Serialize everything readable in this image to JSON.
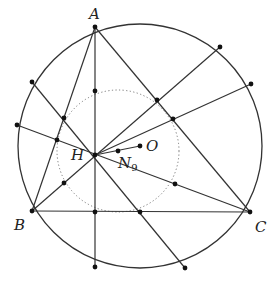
{
  "diagram": {
    "title": "",
    "circumcircle": {
      "cx": 140,
      "cy": 146,
      "r": 122,
      "stroke": "#333333"
    },
    "nine_point_circle": {
      "cx": 118,
      "cy": 151,
      "r": 61,
      "stroke": "#777777",
      "style": "dotted"
    },
    "vertices": {
      "A": {
        "x": 95,
        "y": 27,
        "label": "A",
        "lx": 89,
        "ly": 19
      },
      "B": {
        "x": 32,
        "y": 211,
        "label": "B",
        "lx": 14,
        "ly": 230
      },
      "C": {
        "x": 250,
        "y": 212,
        "label": "C",
        "lx": 255,
        "ly": 232
      }
    },
    "centers": {
      "H": {
        "x": 95,
        "y": 155,
        "label": "H",
        "lx": 71,
        "ly": 160
      },
      "O": {
        "x": 140,
        "y": 146,
        "label": "O",
        "lx": 146,
        "ly": 151
      },
      "N9": {
        "x": 118,
        "y": 151,
        "label": "N",
        "sub": "9",
        "lx": 118,
        "ly": 168
      }
    },
    "segments": [
      {
        "from": [
          95,
          27
        ],
        "to": [
          32,
          211
        ],
        "name": "side-AB"
      },
      {
        "from": [
          95,
          27
        ],
        "to": [
          250,
          212
        ],
        "name": "side-AC"
      },
      {
        "from": [
          32,
          211
        ],
        "to": [
          250,
          212
        ],
        "name": "side-BC"
      },
      {
        "from": [
          95,
          27
        ],
        "to": [
          95,
          267
        ],
        "name": "altitude-A-extended"
      },
      {
        "from": [
          32,
          211
        ],
        "to": [
          220,
          47
        ],
        "name": "line-B-through-H"
      },
      {
        "from": [
          250,
          212
        ],
        "to": [
          17,
          125
        ],
        "name": "line-C-through-H"
      },
      {
        "from": [
          32,
          82
        ],
        "to": [
          185,
          268
        ],
        "name": "line-through-H-2"
      },
      {
        "from": [
          95,
          155
        ],
        "to": [
          251,
          84
        ],
        "name": "line-H-to-arc"
      },
      {
        "from": [
          95,
          155
        ],
        "to": [
          140,
          146
        ],
        "name": "euler-segment-HO"
      }
    ],
    "circumcircle_points": [
      {
        "x": 32,
        "y": 82
      },
      {
        "x": 17,
        "y": 125
      },
      {
        "x": 220,
        "y": 47
      },
      {
        "x": 251,
        "y": 84
      },
      {
        "x": 95,
        "y": 267
      },
      {
        "x": 185,
        "y": 268
      }
    ],
    "nine_point_points": [
      {
        "x": 95,
        "y": 91
      },
      {
        "x": 64,
        "y": 118
      },
      {
        "x": 57,
        "y": 140
      },
      {
        "x": 157,
        "y": 100
      },
      {
        "x": 173,
        "y": 119
      },
      {
        "x": 175,
        "y": 184
      },
      {
        "x": 95,
        "y": 212
      },
      {
        "x": 140,
        "y": 212
      },
      {
        "x": 64,
        "y": 183
      }
    ],
    "colors": {
      "line": "#333333",
      "point": "#111111",
      "dotted": "#888888"
    }
  }
}
